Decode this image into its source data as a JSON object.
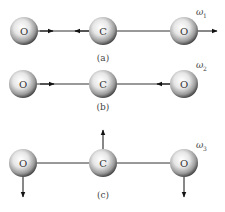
{
  "diagram": {
    "panels": [
      {
        "id": "a",
        "caption": "(a)",
        "mode_label": "ω",
        "mode_sub": "1",
        "atoms": [
          {
            "symbol": "O",
            "x": 24,
            "y": 31
          },
          {
            "symbol": "C",
            "x": 103,
            "y": 31
          },
          {
            "symbol": "O",
            "x": 184,
            "y": 31
          }
        ],
        "mode_type": "symmetric stretch"
      },
      {
        "id": "b",
        "caption": "(b)",
        "mode_label": "ω",
        "mode_sub": "2",
        "atoms": [
          {
            "symbol": "O",
            "x": 23,
            "y": 84
          },
          {
            "symbol": "C",
            "x": 103,
            "y": 84
          },
          {
            "symbol": "O",
            "x": 184,
            "y": 84
          }
        ],
        "mode_type": "asymmetric stretch"
      },
      {
        "id": "c",
        "caption": "(c)",
        "mode_label": "ω",
        "mode_sub": "3",
        "atoms": [
          {
            "symbol": "O",
            "x": 23,
            "y": 163
          },
          {
            "symbol": "C",
            "x": 103,
            "y": 163
          },
          {
            "symbol": "O",
            "x": 184,
            "y": 163
          }
        ],
        "mode_type": "bending"
      }
    ],
    "colors": {
      "bond": "#333333",
      "arrow": "#111111",
      "atom_light": "#ffffff",
      "atom_dark": "#5a5a5a"
    }
  }
}
